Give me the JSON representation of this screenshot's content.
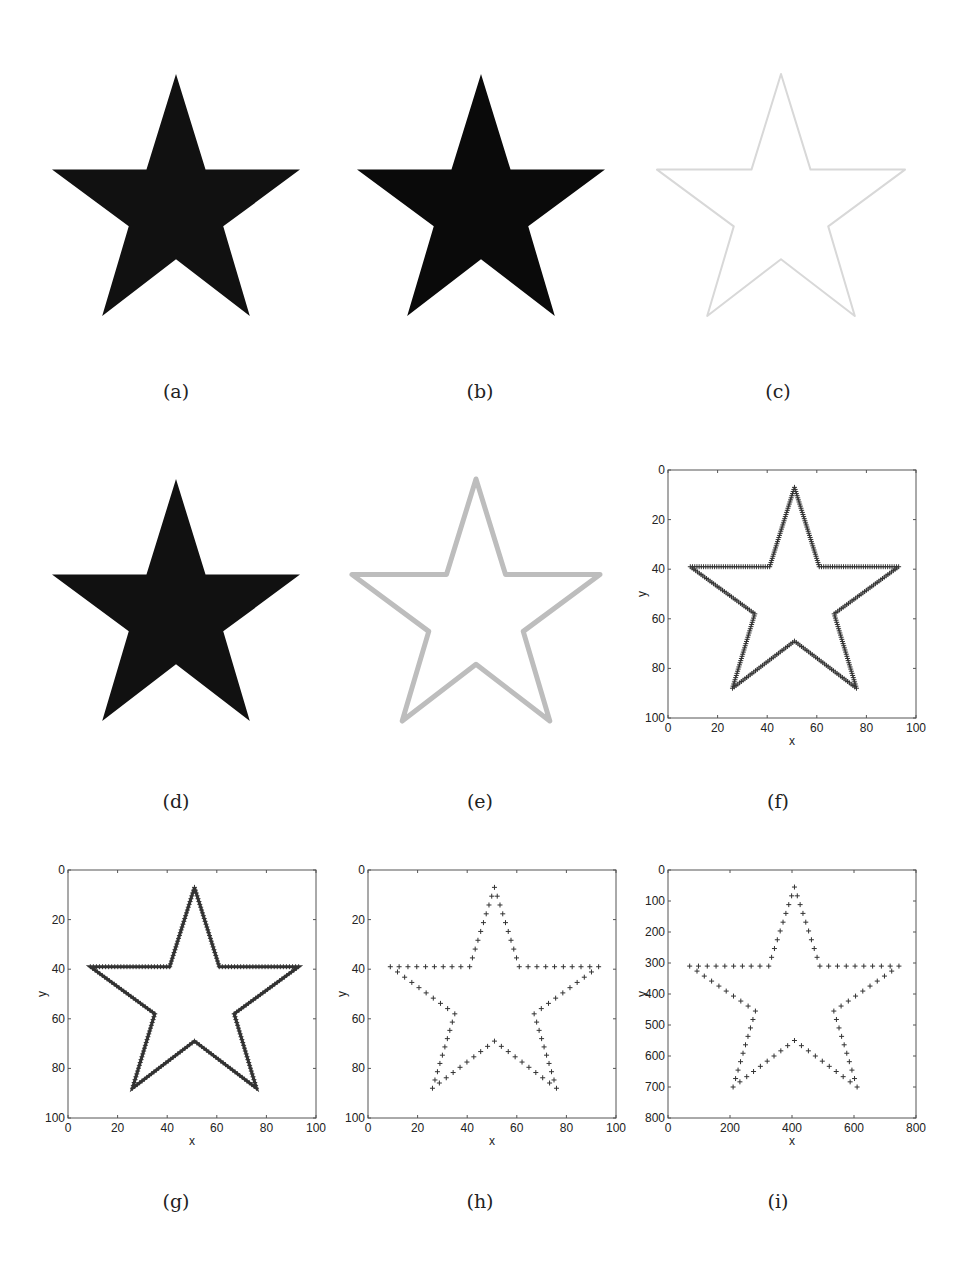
{
  "figure": {
    "panels": [
      {
        "id": "a",
        "caption": "(a)",
        "kind": "image",
        "style": "filled-black"
      },
      {
        "id": "b",
        "caption": "(b)",
        "kind": "image",
        "style": "filled-black-sharp"
      },
      {
        "id": "c",
        "caption": "(c)",
        "kind": "image",
        "style": "faint-outline"
      },
      {
        "id": "d",
        "caption": "(d)",
        "kind": "image",
        "style": "filled-black"
      },
      {
        "id": "e",
        "caption": "(e)",
        "kind": "image",
        "style": "gray-outline"
      },
      {
        "id": "f",
        "caption": "(f)",
        "kind": "plot"
      },
      {
        "id": "g",
        "caption": "(g)",
        "kind": "plot"
      },
      {
        "id": "h",
        "caption": "(h)",
        "kind": "plot"
      },
      {
        "id": "i",
        "caption": "(i)",
        "kind": "plot"
      }
    ]
  },
  "chart_data": [
    {
      "panel": "f",
      "type": "scatter",
      "marker": "+",
      "density": "dense",
      "xlabel": "x",
      "ylabel": "y",
      "xlim": [
        0,
        100
      ],
      "ylim": [
        100,
        0
      ],
      "xticks": [
        "0",
        "20",
        "40",
        "60",
        "80",
        "100"
      ],
      "yticks": [
        "0",
        "20",
        "40",
        "60",
        "80",
        "100"
      ],
      "vertices": [
        [
          51,
          7
        ],
        [
          61,
          39
        ],
        [
          93,
          39
        ],
        [
          67,
          58
        ],
        [
          76,
          88
        ],
        [
          51,
          69
        ],
        [
          26,
          88
        ],
        [
          35,
          58
        ],
        [
          9,
          39
        ],
        [
          41,
          39
        ]
      ]
    },
    {
      "panel": "g",
      "type": "line",
      "marker": "+",
      "density": "continuous",
      "xlabel": "x",
      "ylabel": "y",
      "xlim": [
        0,
        100
      ],
      "ylim": [
        100,
        0
      ],
      "xticks": [
        "0",
        "20",
        "40",
        "60",
        "80",
        "100"
      ],
      "yticks": [
        "0",
        "20",
        "40",
        "60",
        "80",
        "100"
      ],
      "vertices": [
        [
          51,
          7
        ],
        [
          61,
          39
        ],
        [
          93,
          39
        ],
        [
          67,
          58
        ],
        [
          76,
          88
        ],
        [
          51,
          69
        ],
        [
          26,
          88
        ],
        [
          35,
          58
        ],
        [
          9,
          39
        ],
        [
          41,
          39
        ]
      ]
    },
    {
      "panel": "h",
      "type": "scatter",
      "marker": "+",
      "density": "sparse",
      "xlabel": "x",
      "ylabel": "y",
      "xlim": [
        0,
        100
      ],
      "ylim": [
        100,
        0
      ],
      "xticks": [
        "0",
        "20",
        "40",
        "60",
        "80",
        "100"
      ],
      "yticks": [
        "0",
        "20",
        "40",
        "60",
        "80",
        "100"
      ],
      "vertices": [
        [
          51,
          7
        ],
        [
          61,
          39
        ],
        [
          93,
          39
        ],
        [
          67,
          58
        ],
        [
          76,
          88
        ],
        [
          51,
          69
        ],
        [
          26,
          88
        ],
        [
          35,
          58
        ],
        [
          9,
          39
        ],
        [
          41,
          39
        ]
      ]
    },
    {
      "panel": "i",
      "type": "scatter",
      "marker": "+",
      "density": "sparse",
      "xlabel": "x",
      "ylabel": "y",
      "xlim": [
        0,
        800
      ],
      "ylim": [
        800,
        0
      ],
      "xticks": [
        "0",
        "200",
        "400",
        "600",
        "800"
      ],
      "yticks": [
        "0",
        "100",
        "200",
        "300",
        "400",
        "500",
        "600",
        "700",
        "800"
      ],
      "vertices": [
        [
          408,
          55
        ],
        [
          490,
          310
        ],
        [
          745,
          310
        ],
        [
          535,
          455
        ],
        [
          610,
          700
        ],
        [
          408,
          550
        ],
        [
          210,
          700
        ],
        [
          282,
          455
        ],
        [
          70,
          310
        ],
        [
          325,
          310
        ]
      ]
    }
  ]
}
